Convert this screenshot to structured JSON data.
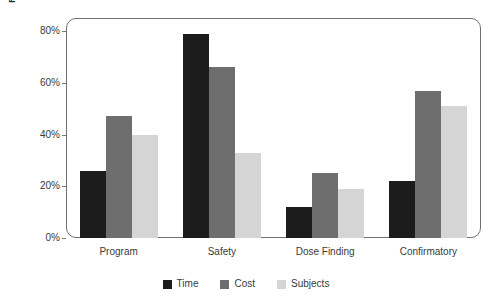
{
  "chart_data": {
    "type": "bar",
    "title": "",
    "xlabel": "",
    "ylabel": "Reduction Over Traditional",
    "categories": [
      "Program",
      "Safety",
      "Dose Finding",
      "Confirmatory"
    ],
    "series": [
      {
        "name": "Time",
        "color": "#1c1c1c",
        "values": [
          26,
          79,
          12,
          22
        ]
      },
      {
        "name": "Cost",
        "color": "#6e6e6e",
        "values": [
          47,
          66,
          25,
          57
        ]
      },
      {
        "name": "Subjects",
        "color": "#d5d5d5",
        "values": [
          40,
          33,
          19,
          51
        ]
      }
    ],
    "ylim": [
      0,
      80
    ],
    "yticks": [
      0,
      20,
      40,
      60,
      80
    ],
    "ytick_labels": [
      "0%",
      "20%",
      "40%",
      "60%",
      "80%"
    ],
    "grid": false,
    "legend_position": "bottom",
    "value_unit": "%"
  },
  "axis": {
    "y_title": "Reduction Over Traditional"
  },
  "legend": {
    "items": [
      {
        "label": "Time"
      },
      {
        "label": "Cost"
      },
      {
        "label": "Subjects"
      }
    ]
  }
}
